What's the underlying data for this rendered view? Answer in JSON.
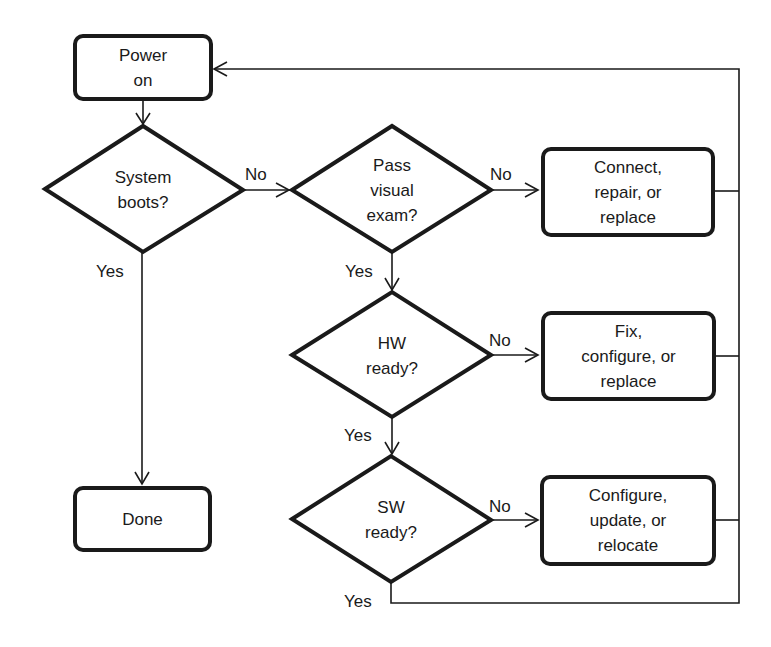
{
  "diagram": {
    "type": "flowchart",
    "nodes": {
      "power_on": {
        "label": "Power\non",
        "shape": "rounded-rect"
      },
      "system_boots": {
        "label": "System\nboots?",
        "shape": "diamond"
      },
      "pass_visual": {
        "label": "Pass\nvisual\nexam?",
        "shape": "diamond"
      },
      "connect": {
        "label": "Connect,\nrepair, or\nreplace",
        "shape": "rounded-rect"
      },
      "hw_ready": {
        "label": "HW\nready?",
        "shape": "diamond"
      },
      "fix": {
        "label": "Fix,\nconfigure, or\nreplace",
        "shape": "rounded-rect"
      },
      "sw_ready": {
        "label": "SW\nready?",
        "shape": "diamond"
      },
      "configure": {
        "label": "Configure,\nupdate, or\nrelocate",
        "shape": "rounded-rect"
      },
      "done": {
        "label": "Done",
        "shape": "rounded-rect"
      }
    },
    "edge_labels": {
      "boots_no": "No",
      "boots_yes": "Yes",
      "visual_no": "No",
      "visual_yes": "Yes",
      "hw_no": "No",
      "hw_yes": "Yes",
      "sw_no": "No",
      "sw_yes": "Yes"
    },
    "edges": [
      {
        "from": "power_on",
        "to": "system_boots"
      },
      {
        "from": "system_boots",
        "to": "pass_visual",
        "label": "No"
      },
      {
        "from": "system_boots",
        "to": "done",
        "label": "Yes"
      },
      {
        "from": "pass_visual",
        "to": "connect",
        "label": "No"
      },
      {
        "from": "pass_visual",
        "to": "hw_ready",
        "label": "Yes"
      },
      {
        "from": "hw_ready",
        "to": "fix",
        "label": "No"
      },
      {
        "from": "hw_ready",
        "to": "sw_ready",
        "label": "Yes"
      },
      {
        "from": "sw_ready",
        "to": "configure",
        "label": "No"
      },
      {
        "from": "sw_ready",
        "to": "power_on",
        "label": "Yes"
      },
      {
        "from": "connect",
        "to": "power_on"
      },
      {
        "from": "fix",
        "to": "power_on"
      },
      {
        "from": "configure",
        "to": "power_on"
      }
    ],
    "colors": {
      "stroke": "#1a1a1a",
      "background": "#ffffff"
    }
  }
}
